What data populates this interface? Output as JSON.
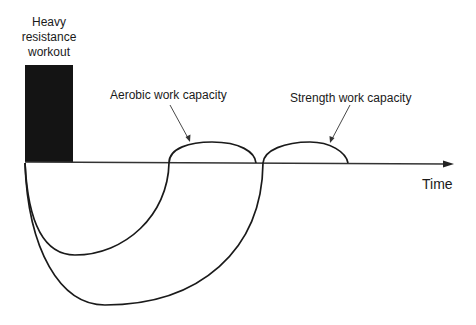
{
  "workout": {
    "label_lines": [
      "Heavy",
      "resistance",
      "workout"
    ]
  },
  "annotations": {
    "aerobic": "Aerobic work capacity",
    "strength": "Strength work capacity"
  },
  "axis": {
    "x_label": "Time"
  },
  "colors": {
    "ink": "#1a1a1a",
    "block": "#141414",
    "axis": "#333333"
  }
}
